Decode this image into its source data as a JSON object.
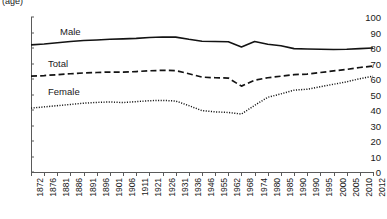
{
  "chart_data": {
    "type": "line",
    "title": "",
    "unit_caption": "(age)",
    "xlabel": "",
    "ylabel": "",
    "ylim": [
      0,
      100
    ],
    "ytick_step": 10,
    "grid": false,
    "legend_position": "inline-annotations",
    "yticks": [
      "100",
      "90",
      "80",
      "70",
      "60",
      "50",
      "40",
      "30",
      "20",
      "10",
      "0"
    ],
    "categories": [
      "1872",
      "1876",
      "1881",
      "1886",
      "1891",
      "1896",
      "1901",
      "1906",
      "1911",
      "1921",
      "1926",
      "1931",
      "1936",
      "1946",
      "1955",
      "1962",
      "1968",
      "1974",
      "1980",
      "1985",
      "1990",
      "1990",
      "1995",
      "2000",
      "2005",
      "2010",
      "2012"
    ],
    "series": [
      {
        "name": "Male",
        "style": "solid",
        "color": "#131313",
        "values": [
          82.0,
          82.6,
          83.4,
          84.2,
          84.8,
          85.2,
          85.6,
          85.9,
          86.2,
          86.8,
          87.1,
          87.0,
          85.6,
          84.4,
          84.2,
          84.0,
          80.6,
          84.2,
          82.4,
          81.4,
          79.6,
          79.4,
          79.2,
          79.0,
          79.2,
          79.6,
          80.0
        ]
      },
      {
        "name": "Total",
        "style": "dashed",
        "color": "#131313",
        "values": [
          61.8,
          62.2,
          62.8,
          63.4,
          63.9,
          64.2,
          64.5,
          64.4,
          64.8,
          65.3,
          65.6,
          65.4,
          63.4,
          61.2,
          60.8,
          60.6,
          55.4,
          59.2,
          60.8,
          61.8,
          62.8,
          63.2,
          64.2,
          65.2,
          66.2,
          67.4,
          68.4
        ]
      },
      {
        "name": "Female",
        "style": "dotted",
        "color": "#131313",
        "values": [
          41.2,
          42.0,
          42.8,
          43.6,
          44.4,
          44.9,
          45.2,
          44.8,
          45.4,
          46.0,
          46.2,
          45.8,
          42.8,
          39.6,
          38.8,
          38.4,
          37.4,
          43.0,
          48.2,
          50.4,
          52.8,
          53.4,
          55.0,
          56.6,
          58.2,
          60.2,
          61.8
        ]
      }
    ]
  },
  "labels": {
    "male": "Male",
    "total": "Total",
    "female": "Female"
  }
}
